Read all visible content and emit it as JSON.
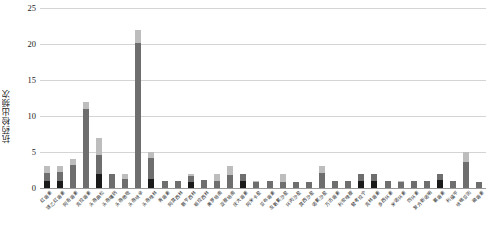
{
  "chart_data": {
    "type": "bar",
    "stacked": true,
    "title": "",
    "xlabel": "",
    "ylabel": "抗药检出频次",
    "ylim": [
      0,
      25
    ],
    "yticks": [
      0,
      5,
      10,
      15,
      20,
      25
    ],
    "grid": true,
    "legend": "none",
    "orientation": "vertical",
    "categories": [
      "红霉素",
      "琥乙红霉素",
      "阿奇霉素",
      "克拉霉素",
      "头孢曲松",
      "头孢噻肟",
      "头孢他啶",
      "头孢呋辛",
      "头孢唑林",
      "青霉素",
      "阿莫西林",
      "氨苄西林",
      "哌拉西林",
      "美罗培南",
      "亚胺培南",
      "庆大霉素",
      "阿米卡星",
      "妥布霉素",
      "左氧氟沙星",
      "环丙沙星",
      "莫西沙星",
      "诺氟沙星",
      "万古霉素",
      "利奈唑胺",
      "替考拉宁",
      "克林霉素",
      "多西环素",
      "米诺环素",
      "四环素",
      "复方新诺明",
      "氯霉素",
      "利福平",
      "呋喃妥因",
      "磷霉素"
    ],
    "series": [
      {
        "name": "段1",
        "color": "#1a1a1a",
        "values": [
          1,
          1,
          0,
          0,
          2,
          0,
          0,
          0,
          1.2,
          0,
          0,
          0.8,
          0,
          0,
          0,
          1,
          0,
          0,
          0,
          0,
          0,
          0,
          0,
          0,
          1,
          1,
          0,
          0,
          0,
          0,
          1.1,
          0,
          0,
          0
        ]
      },
      {
        "name": "段2",
        "color": "#6e6e6e",
        "values": [
          1.1,
          1.2,
          3.2,
          11.0,
          2.6,
          2.0,
          1.2,
          20.1,
          3.0,
          1.0,
          1.0,
          0.9,
          1.1,
          1.0,
          1.8,
          1.0,
          0.9,
          1.0,
          0.9,
          0.9,
          0.9,
          2.1,
          1.0,
          1.0,
          0.9,
          1.0,
          1.0,
          0.9,
          1.0,
          1.0,
          0.9,
          1.0,
          3.6,
          0.9
        ]
      },
      {
        "name": "段3",
        "color": "#bdbdbd",
        "values": [
          0.9,
          0.8,
          0.8,
          1.0,
          2.4,
          0,
          0.8,
          1.9,
          0.8,
          0,
          0,
          0.3,
          0,
          1.0,
          1.2,
          0,
          0.1,
          0,
          1.1,
          0,
          0,
          0.9,
          0,
          0,
          0.1,
          0,
          0,
          0.1,
          0,
          0,
          0,
          0,
          1.4,
          0
        ]
      }
    ],
    "totals": [
      3,
      3,
      4,
      12,
      7,
      2,
      2,
      22,
      5,
      1,
      1,
      2,
      1.1,
      2,
      3,
      2,
      1,
      1,
      2,
      0.9,
      0.9,
      3,
      1,
      1,
      2,
      2,
      1,
      1,
      1,
      1,
      2,
      1,
      5,
      0.9
    ]
  }
}
